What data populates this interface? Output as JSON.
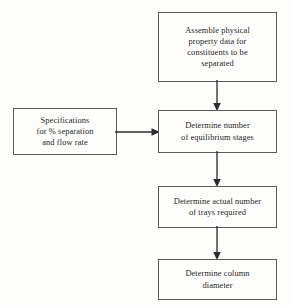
{
  "diagram": {
    "type": "flowchart",
    "orientation": "top-to-bottom with one side input",
    "background_color": "#fdfdfc",
    "box_border_color": "#5a5a5a",
    "text_color": "#1d1d1d",
    "arrow_color": "#2b2b2b",
    "nodes": [
      {
        "id": "assemble",
        "label": "Assemble physical\nproperty data for\nconstituents to be\nseparated",
        "lines": [
          "Assemble physical",
          "property data for",
          "constituents to be",
          "separated"
        ],
        "shape": "rectangle"
      },
      {
        "id": "specs",
        "label": "Specifications\nfor % separation\nand flow rate",
        "lines": [
          "Specifications",
          "for % separation",
          "and flow rate"
        ],
        "shape": "rectangle"
      },
      {
        "id": "equilibrium",
        "label": "Determine number\nof equilibrium stages",
        "lines": [
          "Determine number",
          "of equilibrium stages"
        ],
        "shape": "rectangle"
      },
      {
        "id": "trays",
        "label": "Determine actual number\nof trays required",
        "lines": [
          "Determine actual number",
          "of trays required"
        ],
        "shape": "rectangle"
      },
      {
        "id": "diameter",
        "label": "Determine column\ndiameter",
        "lines": [
          "Determine column",
          "diameter"
        ],
        "shape": "rectangle"
      }
    ],
    "edges": [
      {
        "id": "assemble-equilibrium",
        "from": "assemble",
        "to": "equilibrium",
        "direction": "down",
        "arrowhead": "solid-triangle"
      },
      {
        "id": "specs-equilibrium",
        "from": "specs",
        "to": "equilibrium",
        "direction": "right",
        "arrowhead": "solid-triangle"
      },
      {
        "id": "equilibrium-trays",
        "from": "equilibrium",
        "to": "trays",
        "direction": "down",
        "arrowhead": "solid-triangle"
      },
      {
        "id": "trays-diameter",
        "from": "trays",
        "to": "diameter",
        "direction": "down",
        "arrowhead": "solid-triangle"
      }
    ]
  }
}
